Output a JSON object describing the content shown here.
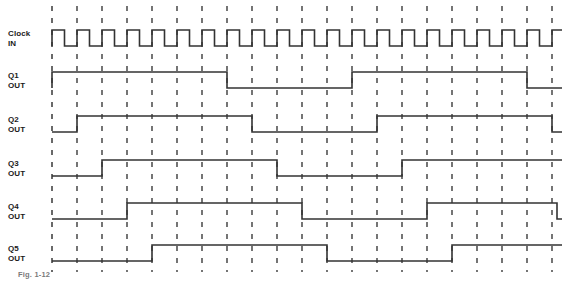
{
  "figure": {
    "caption": "Fig. 1-12",
    "width": 575,
    "height": 281,
    "background_color": "#ffffff",
    "trace_color": "#333333",
    "gridline_color": "#1a1a1a",
    "gridline_style": "dashed-vertical"
  },
  "geometry": {
    "plot_left": 52,
    "plot_right": 562,
    "tick_spacing": 25.0,
    "tick_count": 21,
    "amplitude": 16,
    "label_x": 8,
    "rows_baseline": [
      46,
      88,
      132,
      176,
      219,
      261
    ]
  },
  "chart_data": {
    "type": "timing-diagram",
    "xlabel": "",
    "ylabel": "",
    "time_unit": "clock tick",
    "tick_positions": [
      0,
      1,
      2,
      3,
      4,
      5,
      6,
      7,
      8,
      9,
      10,
      11,
      12,
      13,
      14,
      15,
      16,
      17,
      18,
      19,
      20
    ],
    "signals": [
      {
        "name": "Clock IN",
        "label_line1": "Clock",
        "label_line2": "IN",
        "row": 0,
        "baseline_y": 46,
        "high_y": 30,
        "kind": "clock",
        "initial_level": 0,
        "start_tick": 0,
        "duty": 0.5,
        "period_ticks": 1,
        "cycles": 20,
        "transitions_ticks": [
          0,
          0.5,
          1,
          1.5,
          2,
          2.5,
          3,
          3.5,
          4,
          4.5,
          5,
          5.5,
          6,
          6.5,
          7,
          7.5,
          8,
          8.5,
          9,
          9.5,
          10,
          10.5,
          11,
          11.5,
          12,
          12.5,
          13,
          13.5,
          14,
          14.5,
          15,
          15.5,
          16,
          16.5,
          17,
          17.5,
          18,
          18.5,
          19,
          19.5,
          20
        ]
      },
      {
        "name": "Q1 OUT",
        "label_line1": "Q1",
        "label_line2": "OUT",
        "row": 1,
        "baseline_y": 88,
        "high_y": 72,
        "kind": "square",
        "initial_level": 0,
        "transitions_ticks": [
          0,
          7,
          12,
          19
        ]
      },
      {
        "name": "Q2 OUT",
        "label_line1": "Q2",
        "label_line2": "OUT",
        "row": 2,
        "baseline_y": 132,
        "high_y": 116,
        "kind": "square",
        "initial_level": 0,
        "transitions_ticks": [
          1,
          8,
          13,
          20
        ]
      },
      {
        "name": "Q3 OUT",
        "label_line1": "Q3",
        "label_line2": "OUT",
        "row": 3,
        "baseline_y": 176,
        "high_y": 160,
        "kind": "square",
        "initial_level": 0,
        "transitions_ticks": [
          2,
          9,
          14
        ]
      },
      {
        "name": "Q4 OUT",
        "label_line1": "Q4",
        "label_line2": "OUT",
        "row": 4,
        "baseline_y": 219,
        "high_y": 203,
        "kind": "square",
        "initial_level": 0,
        "transitions_ticks": [
          3,
          10,
          15,
          20.2
        ]
      },
      {
        "name": "Q5 OUT",
        "label_line1": "Q5",
        "label_line2": "OUT",
        "row": 5,
        "baseline_y": 261,
        "high_y": 245,
        "kind": "square",
        "initial_level": 0,
        "transitions_ticks": [
          4,
          11,
          16
        ]
      }
    ],
    "gridlines_ticks": [
      0,
      1,
      2,
      3,
      4,
      5,
      6,
      7,
      8,
      9,
      10,
      11,
      12,
      13,
      14,
      15,
      16,
      17,
      18,
      19,
      20
    ],
    "legend": [],
    "grid": true
  }
}
